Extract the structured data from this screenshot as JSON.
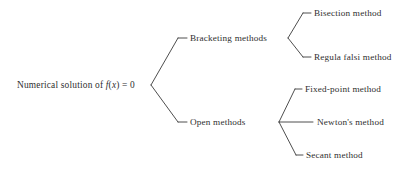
{
  "diagram": {
    "type": "tree",
    "orientation": "left-to-right",
    "background_color": "#ffffff",
    "line_color": "#3a3a3a",
    "text_color": "#2f2f2f",
    "root": {
      "id": "root",
      "label_prefix": "Numerical solution of ",
      "label_var_f": "f",
      "label_paren_open": "(",
      "label_var_x": "x",
      "label_suffix": ") = 0",
      "label_plain": "Numerical solution of f(x) = 0"
    },
    "level2": [
      {
        "id": "bracketing",
        "label": "Bracketing methods"
      },
      {
        "id": "open",
        "label": "Open methods"
      }
    ],
    "level3": [
      {
        "id": "bisection",
        "label": "Bisection method",
        "parent": "bracketing"
      },
      {
        "id": "regula-falsi",
        "label": "Regula falsi method",
        "parent": "bracketing"
      },
      {
        "id": "fixed-point",
        "label": "Fixed-point method",
        "parent": "open"
      },
      {
        "id": "newtons",
        "label": "Newton's method",
        "parent": "open"
      },
      {
        "id": "secant",
        "label": "Secant method",
        "parent": "open"
      }
    ]
  }
}
